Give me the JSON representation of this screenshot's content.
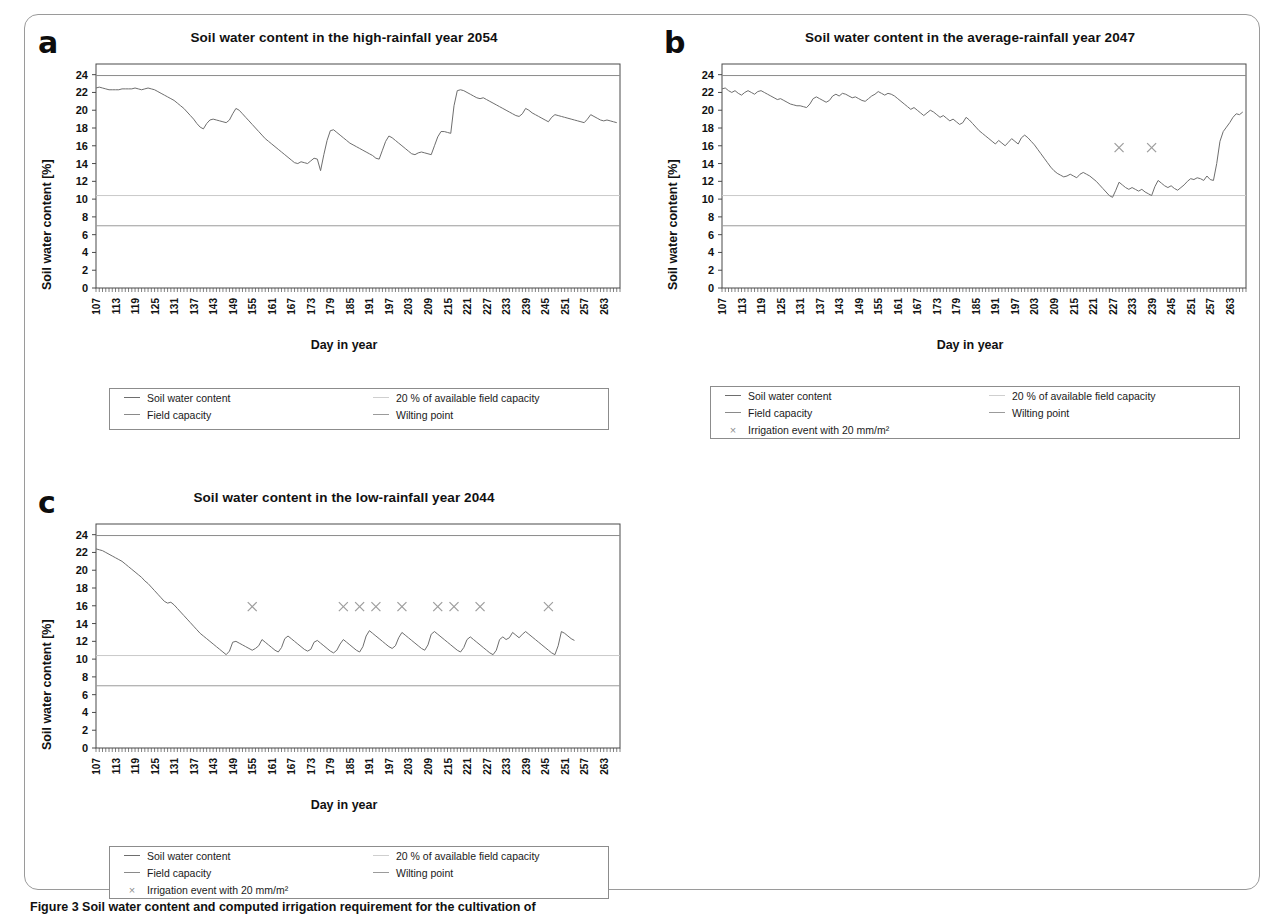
{
  "figure": {
    "caption_bold": "Figure 3 Soil water content and computed irrigation requirement for the cultivation of",
    "caption_rest": " maize ... Soil water content under irrigation"
  },
  "axis": {
    "ylabel": "Soil water content [%]",
    "xlabel": "Day in year",
    "yticks": [
      0,
      2,
      4,
      6,
      8,
      10,
      12,
      14,
      16,
      18,
      20,
      22,
      24
    ],
    "ylim": [
      0,
      25.2
    ],
    "xticks": [
      107,
      113,
      119,
      125,
      131,
      137,
      143,
      149,
      155,
      161,
      167,
      173,
      179,
      185,
      191,
      197,
      203,
      209,
      215,
      221,
      227,
      233,
      239,
      245,
      251,
      257,
      263
    ],
    "xlim": [
      107,
      268
    ]
  },
  "legend": {
    "soil_water_content": "Soil water content",
    "field_capacity": "Field capacity",
    "irrigation_event": "Irrigation event with 20 mm/m²",
    "available_field_capacity": "20 % of available field capacity",
    "wilting_point": "Wilting point",
    "marker_glyph": "×"
  },
  "colors": {
    "series_line": "#6e6e6e",
    "field_capacity_line": "#8a8a8a",
    "afc_line": "#c9c9c9",
    "wilting_line": "#9b9b9b",
    "marker": "#9d9d9d",
    "axis": "#4a4a4a"
  },
  "reference_lines": {
    "field_capacity": 23.9,
    "available_field_capacity_20pct": 10.4,
    "wilting_point": 7.0
  },
  "chart_data": [
    {
      "id": "a",
      "letter": "a",
      "type": "line",
      "title": "Soil water content in the high-rainfall year 2054",
      "xlabel": "Day in year",
      "ylabel": "Soil water content [%]",
      "ylim": [
        0,
        25.2
      ],
      "xlim": [
        107,
        268
      ],
      "grid": false,
      "irrigation_events": [],
      "series": [
        {
          "name": "Soil water content",
          "x": [
            107,
            108,
            109,
            110,
            111,
            112,
            113,
            114,
            115,
            116,
            117,
            118,
            119,
            120,
            121,
            122,
            123,
            124,
            125,
            126,
            127,
            128,
            129,
            130,
            131,
            132,
            133,
            134,
            135,
            136,
            137,
            138,
            139,
            140,
            141,
            142,
            143,
            144,
            145,
            146,
            147,
            148,
            149,
            150,
            151,
            152,
            153,
            154,
            155,
            156,
            157,
            158,
            159,
            160,
            161,
            162,
            163,
            164,
            165,
            166,
            167,
            168,
            169,
            170,
            171,
            172,
            173,
            174,
            175,
            176,
            177,
            178,
            179,
            180,
            181,
            182,
            183,
            184,
            185,
            186,
            187,
            188,
            189,
            190,
            191,
            192,
            193,
            194,
            195,
            196,
            197,
            198,
            199,
            200,
            201,
            202,
            203,
            204,
            205,
            206,
            207,
            208,
            209,
            210,
            211,
            212,
            213,
            214,
            215,
            216,
            217,
            218,
            219,
            220,
            221,
            222,
            223,
            224,
            225,
            226,
            227,
            228,
            229,
            230,
            231,
            232,
            233,
            234,
            235,
            236,
            237,
            238,
            239,
            240,
            241,
            242,
            243,
            244,
            245,
            246,
            247,
            248,
            249,
            250,
            251,
            252,
            253,
            254,
            255,
            256,
            257,
            258,
            259,
            260,
            261,
            262,
            263,
            264,
            265,
            266,
            267
          ],
          "y": [
            22.5,
            22.6,
            22.5,
            22.4,
            22.3,
            22.3,
            22.3,
            22.3,
            22.4,
            22.4,
            22.4,
            22.4,
            22.5,
            22.4,
            22.3,
            22.4,
            22.5,
            22.4,
            22.3,
            22.1,
            21.9,
            21.7,
            21.5,
            21.3,
            21.1,
            20.8,
            20.5,
            20.2,
            19.8,
            19.4,
            19.0,
            18.5,
            18.1,
            17.9,
            18.5,
            18.9,
            19.0,
            18.9,
            18.8,
            18.7,
            18.6,
            18.9,
            19.6,
            20.2,
            20.0,
            19.6,
            19.2,
            18.8,
            18.4,
            18.0,
            17.6,
            17.2,
            16.8,
            16.5,
            16.2,
            15.9,
            15.6,
            15.3,
            15.0,
            14.7,
            14.4,
            14.1,
            14.0,
            14.2,
            14.1,
            14.0,
            14.3,
            14.6,
            14.5,
            13.2,
            15.0,
            16.6,
            17.7,
            17.8,
            17.5,
            17.2,
            16.9,
            16.6,
            16.3,
            16.1,
            15.9,
            15.7,
            15.5,
            15.3,
            15.1,
            14.9,
            14.6,
            14.5,
            15.5,
            16.5,
            17.1,
            16.9,
            16.6,
            16.3,
            16.0,
            15.7,
            15.4,
            15.1,
            15.0,
            15.2,
            15.3,
            15.2,
            15.1,
            15.0,
            16.0,
            17.0,
            17.6,
            17.6,
            17.5,
            17.4,
            20.5,
            22.2,
            22.3,
            22.2,
            22.0,
            21.8,
            21.6,
            21.4,
            21.3,
            21.4,
            21.2,
            21.0,
            20.8,
            20.6,
            20.4,
            20.2,
            20.0,
            19.8,
            19.6,
            19.4,
            19.3,
            19.6,
            20.2,
            20.0,
            19.7,
            19.5,
            19.3,
            19.1,
            18.9,
            18.7,
            19.2,
            19.5,
            19.4,
            19.3,
            19.2,
            19.1,
            19.0,
            18.9,
            18.8,
            18.7,
            18.6,
            19.0,
            19.5,
            19.3,
            19.1,
            18.9,
            18.8,
            18.9,
            18.8,
            18.7,
            18.6
          ]
        }
      ]
    },
    {
      "id": "b",
      "letter": "b",
      "type": "line",
      "title": "Soil water content in the average-rainfall year 2047",
      "xlabel": "Day in year",
      "ylabel": "Soil water content [%]",
      "ylim": [
        0,
        25.2
      ],
      "xlim": [
        107,
        268
      ],
      "grid": false,
      "irrigation_events": [
        229,
        239
      ],
      "irrigation_marker_y": 15.8,
      "series": [
        {
          "name": "Soil water content",
          "x": [
            107,
            108,
            109,
            110,
            111,
            112,
            113,
            114,
            115,
            116,
            117,
            118,
            119,
            120,
            121,
            122,
            123,
            124,
            125,
            126,
            127,
            128,
            129,
            130,
            131,
            132,
            133,
            134,
            135,
            136,
            137,
            138,
            139,
            140,
            141,
            142,
            143,
            144,
            145,
            146,
            147,
            148,
            149,
            150,
            151,
            152,
            153,
            154,
            155,
            156,
            157,
            158,
            159,
            160,
            161,
            162,
            163,
            164,
            165,
            166,
            167,
            168,
            169,
            170,
            171,
            172,
            173,
            174,
            175,
            176,
            177,
            178,
            179,
            180,
            181,
            182,
            183,
            184,
            185,
            186,
            187,
            188,
            189,
            190,
            191,
            192,
            193,
            194,
            195,
            196,
            197,
            198,
            199,
            200,
            201,
            202,
            203,
            204,
            205,
            206,
            207,
            208,
            209,
            210,
            211,
            212,
            213,
            214,
            215,
            216,
            217,
            218,
            219,
            220,
            221,
            222,
            223,
            224,
            225,
            226,
            227,
            228,
            229,
            230,
            231,
            232,
            233,
            234,
            235,
            236,
            237,
            238,
            239,
            240,
            241,
            242,
            243,
            244,
            245,
            246,
            247,
            248,
            249,
            250,
            251,
            252,
            253,
            254,
            255,
            256,
            257,
            258,
            259,
            260,
            261,
            262,
            263,
            264,
            265,
            266,
            267
          ],
          "y": [
            22.4,
            22.5,
            22.2,
            22.0,
            22.2,
            21.9,
            21.7,
            22.0,
            22.2,
            22.0,
            21.8,
            22.1,
            22.2,
            22.0,
            21.8,
            21.6,
            21.4,
            21.2,
            21.3,
            21.1,
            20.9,
            20.7,
            20.6,
            20.5,
            20.5,
            20.4,
            20.3,
            20.7,
            21.3,
            21.5,
            21.3,
            21.1,
            20.9,
            21.1,
            21.6,
            21.8,
            21.6,
            21.9,
            21.8,
            21.6,
            21.4,
            21.5,
            21.3,
            21.1,
            21.0,
            21.3,
            21.6,
            21.8,
            22.1,
            21.9,
            21.7,
            21.9,
            21.8,
            21.6,
            21.3,
            21.0,
            20.7,
            20.4,
            20.1,
            20.3,
            20.0,
            19.7,
            19.4,
            19.7,
            20.0,
            19.8,
            19.5,
            19.2,
            19.4,
            19.1,
            18.8,
            19.0,
            18.7,
            18.4,
            18.6,
            19.2,
            18.9,
            18.5,
            18.1,
            17.7,
            17.4,
            17.1,
            16.8,
            16.5,
            16.2,
            16.6,
            16.3,
            16.0,
            16.4,
            16.8,
            16.5,
            16.2,
            16.9,
            17.2,
            16.9,
            16.5,
            16.1,
            15.6,
            15.1,
            14.6,
            14.1,
            13.6,
            13.2,
            12.9,
            12.7,
            12.5,
            12.6,
            12.8,
            12.6,
            12.4,
            12.8,
            13.0,
            12.8,
            12.6,
            12.3,
            12.0,
            11.6,
            11.2,
            10.8,
            10.4,
            10.2,
            11.0,
            11.9,
            11.6,
            11.3,
            11.1,
            11.3,
            11.1,
            10.9,
            11.1,
            10.8,
            10.6,
            10.4,
            11.4,
            12.1,
            11.8,
            11.5,
            11.3,
            11.5,
            11.2,
            11.0,
            11.3,
            11.6,
            12.0,
            12.3,
            12.2,
            12.4,
            12.3,
            12.1,
            12.6,
            12.2,
            12.1,
            14.0,
            16.5,
            17.6,
            18.1,
            18.6,
            19.2,
            19.6,
            19.5,
            19.8,
            20.0,
            20.3,
            20.6,
            20.4,
            20.6
          ]
        }
      ]
    },
    {
      "id": "c",
      "letter": "c",
      "type": "line",
      "title": "Soil water content in the low-rainfall year 2044",
      "xlabel": "Day in year",
      "ylabel": "Soil water content [%]",
      "ylim": [
        0,
        25.2
      ],
      "xlim": [
        107,
        268
      ],
      "grid": false,
      "irrigation_events": [
        155,
        183,
        188,
        193,
        201,
        212,
        217,
        225,
        246
      ],
      "irrigation_marker_y": 15.9,
      "series": [
        {
          "name": "Soil water content",
          "x": [
            107,
            108,
            109,
            110,
            111,
            112,
            113,
            114,
            115,
            116,
            117,
            118,
            119,
            120,
            121,
            122,
            123,
            124,
            125,
            126,
            127,
            128,
            129,
            130,
            131,
            132,
            133,
            134,
            135,
            136,
            137,
            138,
            139,
            140,
            141,
            142,
            143,
            144,
            145,
            146,
            147,
            148,
            149,
            150,
            151,
            152,
            153,
            154,
            155,
            156,
            157,
            158,
            159,
            160,
            161,
            162,
            163,
            164,
            165,
            166,
            167,
            168,
            169,
            170,
            171,
            172,
            173,
            174,
            175,
            176,
            177,
            178,
            179,
            180,
            181,
            182,
            183,
            184,
            185,
            186,
            187,
            188,
            189,
            190,
            191,
            192,
            193,
            194,
            195,
            196,
            197,
            198,
            199,
            200,
            201,
            202,
            203,
            204,
            205,
            206,
            207,
            208,
            209,
            210,
            211,
            212,
            213,
            214,
            215,
            216,
            217,
            218,
            219,
            220,
            221,
            222,
            223,
            224,
            225,
            226,
            227,
            228,
            229,
            230,
            231,
            232,
            233,
            234,
            235,
            236,
            237,
            238,
            239,
            240,
            241,
            242,
            243,
            244,
            245,
            246,
            247,
            248,
            249,
            250,
            251,
            252,
            253,
            254,
            255,
            256,
            257,
            258,
            259,
            260,
            261,
            262,
            263,
            264,
            265,
            266,
            267
          ],
          "y": [
            22.4,
            22.3,
            22.2,
            22.0,
            21.8,
            21.6,
            21.4,
            21.2,
            21.0,
            20.7,
            20.4,
            20.1,
            19.8,
            19.5,
            19.2,
            18.8,
            18.5,
            18.1,
            17.7,
            17.3,
            16.9,
            16.5,
            16.3,
            16.4,
            16.1,
            15.7,
            15.3,
            14.9,
            14.5,
            14.1,
            13.7,
            13.3,
            12.9,
            12.6,
            12.3,
            12.0,
            11.7,
            11.4,
            11.1,
            10.8,
            10.5,
            10.9,
            11.9,
            12.0,
            11.8,
            11.6,
            11.4,
            11.2,
            11.0,
            11.2,
            11.5,
            12.2,
            11.9,
            11.6,
            11.3,
            11.0,
            10.8,
            11.3,
            12.3,
            12.6,
            12.3,
            12.0,
            11.7,
            11.4,
            11.1,
            10.9,
            11.1,
            11.9,
            12.1,
            11.8,
            11.5,
            11.2,
            10.9,
            10.7,
            11.0,
            11.7,
            12.2,
            11.9,
            11.6,
            11.3,
            11.0,
            10.8,
            11.4,
            12.6,
            13.2,
            12.9,
            12.6,
            12.3,
            12.0,
            11.7,
            11.4,
            11.2,
            11.5,
            12.4,
            13.0,
            12.7,
            12.4,
            12.1,
            11.8,
            11.5,
            11.2,
            11.0,
            11.6,
            12.8,
            13.1,
            12.8,
            12.5,
            12.2,
            11.9,
            11.6,
            11.3,
            11.0,
            10.8,
            11.3,
            12.2,
            12.5,
            12.2,
            11.9,
            11.6,
            11.3,
            11.0,
            10.7,
            10.5,
            11.0,
            12.2,
            12.5,
            12.2,
            12.4,
            13.0,
            12.7,
            12.4,
            12.8,
            13.1,
            12.8,
            12.5,
            12.2,
            11.9,
            11.6,
            11.3,
            11.0,
            10.7,
            10.5,
            11.5,
            13.1,
            12.9,
            12.6,
            12.3,
            12.1
          ]
        }
      ]
    }
  ]
}
